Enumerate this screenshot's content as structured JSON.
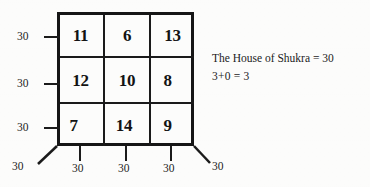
{
  "figure": {
    "title_note": "magic-square-diagram",
    "grid": {
      "rows": [
        [
          "11",
          "6",
          "13"
        ],
        [
          "12",
          "10",
          "8"
        ],
        [
          "7",
          "14",
          "9"
        ]
      ]
    },
    "row_sums": [
      "30",
      "30",
      "30"
    ],
    "col_sums": [
      "30",
      "30",
      "30"
    ],
    "diagonal_sums": {
      "bottom_left": "30",
      "bottom_right": "30"
    },
    "annotation": {
      "line1": "The  House of Shukra = 30",
      "line2": "3+0 = 3"
    },
    "colors": {
      "ink": "#161616",
      "paper": "#fdfdfc"
    }
  }
}
